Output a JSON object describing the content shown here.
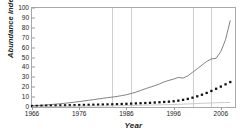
{
  "chart_data": {
    "type": "line",
    "title": "",
    "xlabel": "Year",
    "ylabel": "Abundance index",
    "xlim": [
      1966,
      2009
    ],
    "ylim": [
      0,
      100
    ],
    "grid": "vertical-only",
    "legend": "none",
    "yticks": [
      0,
      10,
      20,
      30,
      40,
      50,
      60,
      70,
      80,
      90,
      100
    ],
    "xticks": [
      1966,
      1976,
      1986,
      1996,
      2006
    ],
    "gridline_years": [
      1983,
      1987,
      2000,
      2004
    ],
    "x": [
      1966,
      1967,
      1968,
      1969,
      1970,
      1971,
      1972,
      1973,
      1974,
      1975,
      1976,
      1977,
      1978,
      1979,
      1980,
      1981,
      1982,
      1983,
      1984,
      1985,
      1986,
      1987,
      1988,
      1989,
      1990,
      1991,
      1992,
      1993,
      1994,
      1995,
      1996,
      1997,
      1998,
      1999,
      2000,
      2001,
      2002,
      2003,
      2004,
      2005,
      2006,
      2007,
      2008
    ],
    "series": [
      {
        "name": "upper-trend-line",
        "style": "thin-solid-line",
        "color": "#6b6b6b",
        "values": [
          1.2,
          1.5,
          1.8,
          2.1,
          2.5,
          2.9,
          3.3,
          3.8,
          4.3,
          4.9,
          5.5,
          6.1,
          6.8,
          7.4,
          8.1,
          8.8,
          9.4,
          10.0,
          10.7,
          11.5,
          12.4,
          13.6,
          15.0,
          16.7,
          18.4,
          20.0,
          21.5,
          23.3,
          25.4,
          26.9,
          28.2,
          29.9,
          29.2,
          31.5,
          35.0,
          38.6,
          42.3,
          46.0,
          48.5,
          49.2,
          56.0,
          68.0,
          87.5
        ]
      },
      {
        "name": "marker-series",
        "style": "square-markers",
        "color": "#121212",
        "values": [
          1.0,
          1.1,
          1.2,
          1.3,
          1.4,
          1.5,
          1.6,
          1.7,
          1.8,
          1.9,
          2.0,
          2.1,
          2.2,
          2.3,
          2.4,
          2.5,
          2.6,
          2.7,
          2.8,
          3.0,
          3.2,
          3.4,
          3.6,
          3.8,
          4.0,
          4.2,
          4.5,
          4.8,
          5.1,
          5.4,
          5.8,
          6.4,
          7.2,
          8.2,
          9.4,
          10.8,
          12.4,
          14.2,
          16.2,
          18.4,
          20.6,
          22.9,
          25.2
        ]
      },
      {
        "name": "baseline-series",
        "style": "faint-solid-line",
        "color": "#bdbdbd",
        "values": [
          0.3,
          0.35,
          0.4,
          0.45,
          0.5,
          0.55,
          0.6,
          0.65,
          0.7,
          0.75,
          0.8,
          0.85,
          0.9,
          0.95,
          1.0,
          1.05,
          1.1,
          1.2,
          1.3,
          1.4,
          1.5,
          1.6,
          1.7,
          1.8,
          1.9,
          2.0,
          2.1,
          2.2,
          2.3,
          2.4,
          2.5,
          2.7,
          2.9,
          3.1,
          3.3,
          3.5,
          3.7,
          3.9,
          4.1,
          4.3,
          4.4,
          4.5,
          4.6
        ]
      }
    ]
  }
}
